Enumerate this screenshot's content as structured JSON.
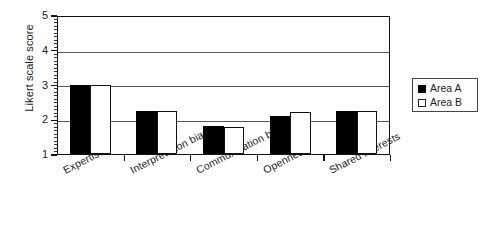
{
  "chart_data": {
    "type": "bar",
    "title": "",
    "subtitle": "",
    "xlabel": "",
    "ylabel": "Likert scale score",
    "ylim": [
      1,
      5
    ],
    "yticks": [
      1,
      2,
      3,
      4,
      5
    ],
    "ytick_labels": [
      "1",
      "2",
      "3",
      "4",
      "5"
    ],
    "minor_tick_step": 0.1,
    "grid": true,
    "grid_axis": "y",
    "legend_position": "right-outside",
    "categories": [
      "Expertise",
      "Interpretation bias",
      "Communication bias",
      "Openness",
      "Shared interests"
    ],
    "series": [
      {
        "name": "Area A",
        "color": "#000000",
        "fill": "solid-black",
        "values": [
          3.0,
          2.25,
          1.82,
          2.1,
          2.25
        ]
      },
      {
        "name": "Area B",
        "color": "#ffffff",
        "fill": "white-outlined",
        "values": [
          3.0,
          2.25,
          1.78,
          2.2,
          2.25
        ]
      }
    ]
  },
  "legend": {
    "entries": [
      {
        "label": "Area A",
        "swatch": "filled-black-square"
      },
      {
        "label": "Area B",
        "swatch": "white-outlined-square"
      }
    ]
  },
  "axes": {
    "y_title": "Likert scale score",
    "y_tick_labels": [
      "5",
      "4",
      "3",
      "2",
      "1"
    ]
  }
}
